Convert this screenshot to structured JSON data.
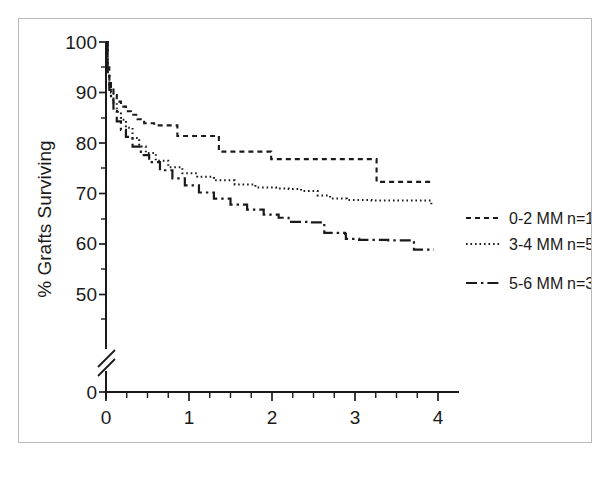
{
  "figure": {
    "border_color": "#b9b9b9",
    "background": "#ffffff",
    "ink_color": "#1a1a1a"
  },
  "chart_data": {
    "type": "line",
    "title": "",
    "subtitle": "",
    "xlabel": "Years",
    "ylabel": "% Grafts Surviving",
    "xlim": [
      0,
      4.25
    ],
    "ylim": [
      45,
      100
    ],
    "y_axis_break": true,
    "y_axis_break_note": "axis broken between 45 and 0",
    "grid": false,
    "legend_position": "right",
    "xticks": [
      0,
      1,
      2,
      3,
      4
    ],
    "xtick_labels": [
      "0",
      "1",
      "2",
      "3",
      "4"
    ],
    "xminor_tick_interval": 0.25,
    "yticks": [
      0,
      50,
      60,
      70,
      80,
      90,
      100
    ],
    "ytick_labels": [
      "0",
      "50",
      "60",
      "70",
      "80",
      "90",
      "100"
    ],
    "yminor_ticks": [
      55,
      65,
      75,
      85,
      95
    ],
    "curve_type": "kaplan-meier-step",
    "series": [
      {
        "name": "0-2 MM",
        "n_label": "n=118",
        "n": 118,
        "line_style": "dashed",
        "points": [
          [
            0.0,
            100.0
          ],
          [
            0.02,
            95.0
          ],
          [
            0.04,
            92.5
          ],
          [
            0.06,
            91.0
          ],
          [
            0.09,
            89.5
          ],
          [
            0.13,
            88.2
          ],
          [
            0.18,
            87.2
          ],
          [
            0.24,
            86.3
          ],
          [
            0.3,
            85.6
          ],
          [
            0.38,
            84.7
          ],
          [
            0.46,
            83.9
          ],
          [
            0.58,
            83.5
          ],
          [
            0.72,
            83.5
          ],
          [
            0.85,
            83.5
          ],
          [
            0.86,
            81.4
          ],
          [
            1.35,
            81.4
          ],
          [
            1.36,
            78.3
          ],
          [
            1.98,
            78.3
          ],
          [
            1.99,
            76.8
          ],
          [
            3.25,
            76.8
          ],
          [
            3.26,
            72.3
          ],
          [
            3.95,
            72.3
          ]
        ]
      },
      {
        "name": "3-4 MM",
        "n_label": "n=554",
        "n": 554,
        "line_style": "dotted",
        "points": [
          [
            0.0,
            100.0
          ],
          [
            0.02,
            94.0
          ],
          [
            0.04,
            91.5
          ],
          [
            0.06,
            90.0
          ],
          [
            0.09,
            88.0
          ],
          [
            0.13,
            86.2
          ],
          [
            0.18,
            84.6
          ],
          [
            0.24,
            83.0
          ],
          [
            0.32,
            81.0
          ],
          [
            0.4,
            79.3
          ],
          [
            0.48,
            78.0
          ],
          [
            0.6,
            76.5
          ],
          [
            0.75,
            75.2
          ],
          [
            0.92,
            74.0
          ],
          [
            1.1,
            73.3
          ],
          [
            1.3,
            72.6
          ],
          [
            1.55,
            71.8
          ],
          [
            1.8,
            71.2
          ],
          [
            2.05,
            71.0
          ],
          [
            2.2,
            70.9
          ],
          [
            2.35,
            70.5
          ],
          [
            2.55,
            69.6
          ],
          [
            2.7,
            69.0
          ],
          [
            2.9,
            68.7
          ],
          [
            3.2,
            68.6
          ],
          [
            3.55,
            68.6
          ],
          [
            3.85,
            68.6
          ],
          [
            3.92,
            67.6
          ]
        ]
      },
      {
        "name": "5-6 MM",
        "n_label": "n=356",
        "n": 356,
        "line_style": "dash-dot",
        "points": [
          [
            0.0,
            100.0
          ],
          [
            0.02,
            93.5
          ],
          [
            0.04,
            90.5
          ],
          [
            0.06,
            88.5
          ],
          [
            0.09,
            86.3
          ],
          [
            0.13,
            84.3
          ],
          [
            0.18,
            82.6
          ],
          [
            0.24,
            81.2
          ],
          [
            0.32,
            79.3
          ],
          [
            0.42,
            77.6
          ],
          [
            0.52,
            76.2
          ],
          [
            0.65,
            74.6
          ],
          [
            0.8,
            73.0
          ],
          [
            0.95,
            71.6
          ],
          [
            1.12,
            70.2
          ],
          [
            1.3,
            69.0
          ],
          [
            1.5,
            67.8
          ],
          [
            1.7,
            66.8
          ],
          [
            1.9,
            65.8
          ],
          [
            2.08,
            65.2
          ],
          [
            2.2,
            64.9
          ],
          [
            2.21,
            64.4
          ],
          [
            2.45,
            64.3
          ],
          [
            2.62,
            64.1
          ],
          [
            2.63,
            62.2
          ],
          [
            2.88,
            62.0
          ],
          [
            2.89,
            61.0
          ],
          [
            3.05,
            60.8
          ],
          [
            3.4,
            60.7
          ],
          [
            3.7,
            60.6
          ],
          [
            3.71,
            58.9
          ],
          [
            3.95,
            58.9
          ]
        ]
      }
    ]
  },
  "legend": {
    "entries": [
      {
        "label": "0-2 MM",
        "count": "n=118",
        "style": "dashed"
      },
      {
        "label": "3-4 MM",
        "count": "n=554",
        "style": "dotted"
      },
      {
        "label": "5-6 MM",
        "count": "n=356",
        "style": "dash-dot"
      }
    ]
  },
  "axes": {
    "x_title": "Years",
    "y_title": "% Grafts Surviving",
    "x_tick_labels": [
      "0",
      "1",
      "2",
      "3",
      "4"
    ],
    "y_tick_labels": [
      "100",
      "90",
      "80",
      "70",
      "60",
      "50",
      "0"
    ]
  }
}
